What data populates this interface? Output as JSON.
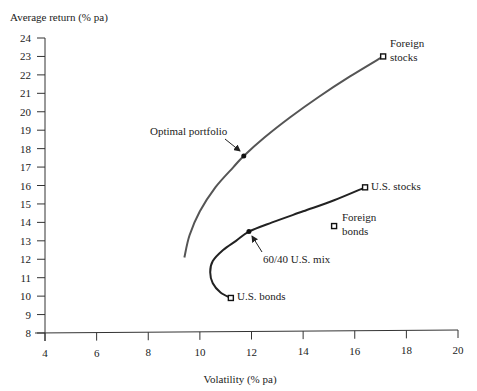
{
  "chart_data": {
    "type": "line",
    "title": "",
    "xlabel": "Volatility (% pa)",
    "ylabel": "Average return (% pa)",
    "xlim": [
      4,
      20
    ],
    "ylim": [
      8,
      24
    ],
    "xticks": [
      4,
      6,
      8,
      10,
      12,
      14,
      16,
      18,
      20
    ],
    "yticks": [
      8,
      9,
      10,
      11,
      12,
      13,
      14,
      15,
      16,
      17,
      18,
      19,
      20,
      21,
      22,
      23,
      24
    ],
    "grid": false,
    "legend": null,
    "series": [
      {
        "name": "Frontier with foreign assets",
        "x": [
          9.4,
          9.6,
          10.0,
          10.6,
          11.3,
          11.7,
          12.5,
          13.5,
          14.6,
          15.8,
          17.1
        ],
        "y": [
          12.1,
          13.3,
          14.6,
          15.9,
          17.0,
          17.6,
          18.6,
          19.7,
          20.8,
          21.9,
          23.0
        ]
      },
      {
        "name": "U.S. stocks/bonds frontier",
        "x": [
          11.2,
          10.8,
          10.5,
          10.4,
          10.5,
          10.9,
          11.4,
          11.9,
          12.8,
          14.0,
          15.2,
          16.4
        ],
        "y": [
          9.9,
          10.2,
          10.7,
          11.3,
          11.9,
          12.5,
          13.0,
          13.5,
          14.0,
          14.6,
          15.2,
          15.9
        ]
      }
    ],
    "points": [
      {
        "name": "Foreign stocks",
        "x": 17.1,
        "y": 23.0,
        "marker": "square"
      },
      {
        "name": "U.S. stocks",
        "x": 16.4,
        "y": 15.9,
        "marker": "square"
      },
      {
        "name": "Foreign bonds",
        "x": 15.2,
        "y": 13.8,
        "marker": "square"
      },
      {
        "name": "U.S. bonds",
        "x": 11.2,
        "y": 9.9,
        "marker": "square"
      },
      {
        "name": "Optimal portfolio",
        "x": 11.7,
        "y": 17.6,
        "marker": "dot"
      },
      {
        "name": "60/40 U.S. mix",
        "x": 11.9,
        "y": 13.5,
        "marker": "dot"
      }
    ],
    "annotations": [
      {
        "text": "Foreign stocks",
        "lines": [
          "Foreign",
          "stocks"
        ]
      },
      {
        "text": "U.S. stocks",
        "lines": [
          "U.S. stocks"
        ]
      },
      {
        "text": "Foreign bonds",
        "lines": [
          "Foreign",
          "bonds"
        ]
      },
      {
        "text": "U.S. bonds",
        "lines": [
          "U.S. bonds"
        ]
      },
      {
        "text": "Optimal portfolio",
        "lines": [
          "Optimal portfolio"
        ],
        "arrow": true
      },
      {
        "text": "60/40 U.S. mix",
        "lines": [
          "60/40 U.S. mix"
        ],
        "arrow": true
      }
    ]
  }
}
